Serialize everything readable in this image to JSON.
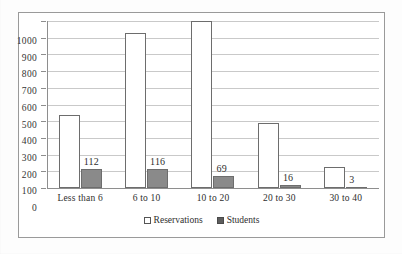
{
  "chart_data": {
    "type": "bar",
    "title": "",
    "xlabel": "",
    "ylabel": "",
    "ylim": [
      0,
      1000
    ],
    "ytick_step": 100,
    "yticks": [
      "0",
      "100",
      "200",
      "300",
      "400",
      "500",
      "600",
      "700",
      "800",
      "900",
      "1000"
    ],
    "grid": true,
    "legend_position": "bottom",
    "categories": [
      "Less than 6",
      "6 to 10",
      "10 to 20",
      "20 to 30",
      "30 to 40"
    ],
    "series": [
      {
        "name": "Reservations",
        "style": "hollow",
        "color": "#ffffff",
        "border_color": "#6d6d6d",
        "values": [
          435,
          930,
          1000,
          390,
          125
        ],
        "labels_shown": false
      },
      {
        "name": "Students",
        "style": "filled",
        "color": "#8a8a8a",
        "border_color": "#6d6d6d",
        "values": [
          112,
          116,
          69,
          16,
          3
        ],
        "labels_shown": true,
        "data_labels": [
          "112",
          "116",
          "69",
          "16",
          "3"
        ]
      }
    ]
  },
  "legend": {
    "items": [
      {
        "label": "Reservations",
        "marker": "hollow-square"
      },
      {
        "label": "Students",
        "marker": "filled-square"
      }
    ]
  },
  "colors": {
    "frame": "#9a9a9a",
    "gridline": "#c9c9c9",
    "axis": "#8e8e8e",
    "text": "#2e2e2e",
    "students_fill": "#8a8a8a",
    "reservations_fill": "#ffffff"
  }
}
